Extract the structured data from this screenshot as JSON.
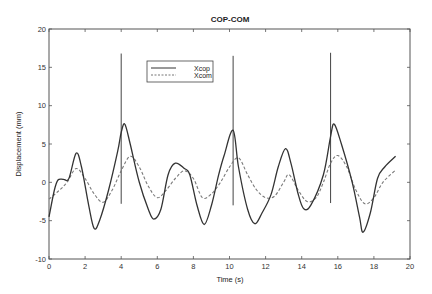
{
  "chart_data": {
    "type": "line",
    "title": "COP-COM",
    "xlabel": "Time (s)",
    "ylabel": "Displacement (mm)",
    "xlim": [
      0,
      20
    ],
    "ylim": [
      -10,
      20
    ],
    "xticks": [
      0,
      2,
      4,
      6,
      8,
      10,
      12,
      14,
      16,
      18,
      20
    ],
    "yticks": [
      -10,
      -5,
      0,
      5,
      10,
      15,
      20
    ],
    "grid": false,
    "legend_position": "upper-center-left",
    "series": [
      {
        "name": "Xcop",
        "style": "solid",
        "color": "#333333",
        "points": [
          [
            0,
            -4.5
          ],
          [
            0.3,
            -1
          ],
          [
            0.5,
            0.3
          ],
          [
            0.8,
            0.4
          ],
          [
            1.1,
            0.5
          ],
          [
            1.5,
            3.8
          ],
          [
            1.8,
            2
          ],
          [
            2.2,
            -3
          ],
          [
            2.5,
            -6
          ],
          [
            2.8,
            -5
          ],
          [
            3.3,
            -1
          ],
          [
            3.8,
            4
          ],
          [
            4.0,
            6.5
          ],
          [
            4.2,
            7.6
          ],
          [
            4.5,
            5
          ],
          [
            5.0,
            0
          ],
          [
            5.5,
            -3.5
          ],
          [
            5.8,
            -4.8
          ],
          [
            6.2,
            -3.5
          ],
          [
            6.6,
            1
          ],
          [
            7.0,
            2.5
          ],
          [
            7.5,
            1.8
          ],
          [
            7.8,
            1
          ],
          [
            8.2,
            -3
          ],
          [
            8.6,
            -5.5
          ],
          [
            9.0,
            -3
          ],
          [
            9.4,
            1
          ],
          [
            9.7,
            3.5
          ],
          [
            10.2,
            6.8
          ],
          [
            10.5,
            2
          ],
          [
            11.0,
            -3.5
          ],
          [
            11.4,
            -5.4
          ],
          [
            11.8,
            -4
          ],
          [
            12.3,
            -1.6
          ],
          [
            12.7,
            2
          ],
          [
            13.1,
            4.4
          ],
          [
            13.4,
            2.5
          ],
          [
            13.8,
            -1.5
          ],
          [
            14.1,
            -3.4
          ],
          [
            14.5,
            -3
          ],
          [
            15.2,
            1
          ],
          [
            15.6,
            6
          ],
          [
            15.8,
            7.6
          ],
          [
            16.2,
            5
          ],
          [
            16.8,
            0
          ],
          [
            17.2,
            -4.5
          ],
          [
            17.4,
            -6.5
          ],
          [
            17.8,
            -4
          ],
          [
            18.2,
            0.5
          ],
          [
            18.6,
            2
          ],
          [
            19.2,
            3.4
          ]
        ]
      },
      {
        "name": "Xcom",
        "style": "dashed",
        "color": "#777777",
        "points": [
          [
            0,
            -2.2
          ],
          [
            0.5,
            -1.2
          ],
          [
            1.0,
            0
          ],
          [
            1.5,
            1.8
          ],
          [
            2.0,
            0.5
          ],
          [
            2.5,
            -1.5
          ],
          [
            3.0,
            -2.6
          ],
          [
            3.5,
            -1
          ],
          [
            4.0,
            1.5
          ],
          [
            4.5,
            3.4
          ],
          [
            5.0,
            2
          ],
          [
            5.5,
            -0.5
          ],
          [
            6.0,
            -2
          ],
          [
            6.5,
            -1
          ],
          [
            7.0,
            0.5
          ],
          [
            7.5,
            1.5
          ],
          [
            8.0,
            0.5
          ],
          [
            8.5,
            -2
          ],
          [
            9.0,
            -1.5
          ],
          [
            9.5,
            0
          ],
          [
            10.0,
            2
          ],
          [
            10.5,
            3.2
          ],
          [
            11.0,
            1
          ],
          [
            11.5,
            -1
          ],
          [
            12.0,
            -2
          ],
          [
            12.5,
            -1.8
          ],
          [
            13.0,
            0
          ],
          [
            13.3,
            1
          ],
          [
            13.8,
            -1
          ],
          [
            14.3,
            -2.5
          ],
          [
            14.8,
            -2
          ],
          [
            15.2,
            0
          ],
          [
            15.6,
            2.5
          ],
          [
            16.0,
            3.5
          ],
          [
            16.5,
            2
          ],
          [
            17.0,
            -1
          ],
          [
            17.5,
            -2.8
          ],
          [
            18.0,
            -2
          ],
          [
            18.5,
            0
          ],
          [
            19.2,
            1.6
          ]
        ]
      }
    ],
    "annotations": [
      {
        "type": "vertical-spike",
        "x": 4.0,
        "y_top": 16.8,
        "y_bottom": -2.8
      },
      {
        "type": "vertical-spike",
        "x": 10.2,
        "y_top": 16.5,
        "y_bottom": -3.0
      },
      {
        "type": "vertical-spike",
        "x": 15.6,
        "y_top": 16.9,
        "y_bottom": -2.7
      }
    ]
  },
  "legend": {
    "items": [
      {
        "label": "Xcop",
        "style": "solid"
      },
      {
        "label": "Xcom",
        "style": "dashed"
      }
    ]
  }
}
